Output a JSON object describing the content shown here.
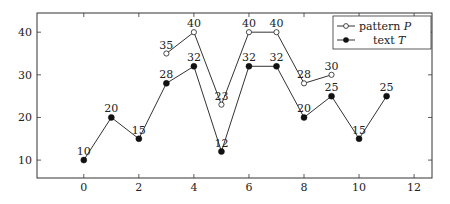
{
  "chart_data": {
    "type": "line",
    "title": "",
    "xlabel": "",
    "ylabel": "",
    "xlim": [
      -1.7,
      12.65
    ],
    "ylim": [
      5.8,
      44.5
    ],
    "xticks": [
      0,
      2,
      4,
      6,
      8,
      10,
      12
    ],
    "yticks": [
      10,
      20,
      30,
      40
    ],
    "grid": false,
    "legend_position": "upper right",
    "series": [
      {
        "name": "pattern P",
        "legend_label": "pattern",
        "legend_var": "P",
        "marker": "open-circle",
        "x": [
          3,
          4,
          5,
          6,
          7,
          8,
          9
        ],
        "values": [
          35,
          40,
          23,
          40,
          40,
          28,
          30
        ]
      },
      {
        "name": "text T",
        "legend_label": "text",
        "legend_var": "T",
        "marker": "filled-circle",
        "x": [
          0,
          1,
          2,
          3,
          4,
          5,
          6,
          7,
          8,
          9,
          10,
          11
        ],
        "values": [
          10,
          20,
          15,
          28,
          32,
          12,
          32,
          32,
          20,
          25,
          15,
          25
        ]
      }
    ]
  },
  "colors": {
    "line": "#333333",
    "axis": "#333333",
    "background": "#ffffff"
  }
}
